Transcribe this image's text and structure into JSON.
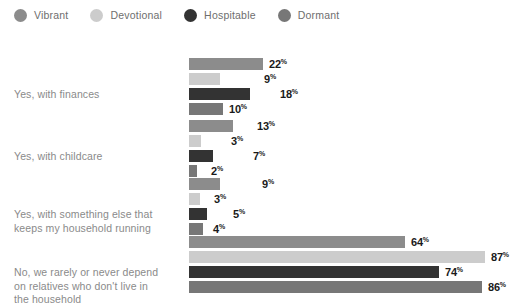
{
  "legend": {
    "items": [
      {
        "label": "Vibrant",
        "color": "#8c8c8c",
        "icon": "circle-swatch-icon"
      },
      {
        "label": "Devotional",
        "color": "#cccccc",
        "icon": "circle-swatch-icon"
      },
      {
        "label": "Hospitable",
        "color": "#333333",
        "icon": "circle-swatch-icon"
      },
      {
        "label": "Dormant",
        "color": "#777777",
        "icon": "circle-swatch-icon"
      }
    ]
  },
  "chart_data": {
    "type": "bar",
    "orientation": "horizontal",
    "title": "",
    "xlabel": "",
    "ylabel": "",
    "xlim": [
      0,
      100
    ],
    "grid": false,
    "legend_position": "top-left",
    "value_suffix": "%",
    "categories": [
      "Yes, with finances",
      "Yes, with childcare",
      "Yes, with something else that keeps my household running",
      "No, we rarely or never depend on relatives who don't live in the household"
    ],
    "category_lines": [
      [
        "Yes, with finances"
      ],
      [
        "Yes, with childcare"
      ],
      [
        "Yes, with something else that",
        "keeps my household running"
      ],
      [
        "No, we rarely or never depend",
        "on relatives who don't live in",
        "the household"
      ]
    ],
    "series": [
      {
        "name": "Vibrant",
        "color": "#8c8c8c",
        "values": [
          22,
          13,
          9,
          64
        ]
      },
      {
        "name": "Devotional",
        "color": "#cccccc",
        "values": [
          9,
          3,
          3,
          87
        ]
      },
      {
        "name": "Hospitable",
        "color": "#333333",
        "values": [
          18,
          7,
          5,
          74
        ]
      },
      {
        "name": "Dormant",
        "color": "#777777",
        "values": [
          10,
          2,
          4,
          86
        ]
      }
    ],
    "value_labels": [
      [
        "22",
        "9",
        "18",
        "10"
      ],
      [
        "13",
        "3",
        "7",
        "2"
      ],
      [
        "9",
        "3",
        "5",
        "4"
      ],
      [
        "64",
        "87",
        "74",
        "86"
      ]
    ],
    "label_offsets_px": [
      [
        6,
        44,
        30,
        6
      ],
      [
        24,
        30,
        40,
        14
      ],
      [
        42,
        14,
        26,
        10
      ],
      [
        6,
        6,
        6,
        6
      ]
    ],
    "bar_widths_px": [
      [
        74,
        31,
        61,
        34
      ],
      [
        44,
        12,
        24,
        8
      ],
      [
        31,
        11,
        18,
        14
      ],
      [
        216,
        296,
        250,
        293
      ]
    ],
    "group_tops_px": [
      28,
      90,
      148,
      206
    ],
    "group_label_tops_px": [
      58,
      120,
      178,
      236
    ]
  }
}
